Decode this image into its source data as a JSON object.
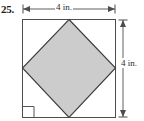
{
  "figure": {
    "problem_number": "25.",
    "shape_outer": "square",
    "shape_inner": "square-rotated-45-inscribed",
    "right_angle_mark": "right-angle-mark",
    "colors": {
      "inner_fill": "#cccccc",
      "outer_fill": "#ffffff",
      "stroke": "#4d4d4d",
      "inner_stroke": "#3a3a3a",
      "text": "#1a1a1a"
    },
    "dimensions": {
      "top": {
        "label": "4 in.",
        "value": 4,
        "unit": "in.",
        "orientation": "horizontal"
      },
      "right": {
        "label": "4 in.",
        "value": 4,
        "unit": "in.",
        "orientation": "vertical"
      }
    },
    "geometry": {
      "square": {
        "left": 22,
        "top": 19,
        "right": 116,
        "bottom": 118
      },
      "diamond_vertices": [
        {
          "name": "top",
          "x": 69,
          "y": 19
        },
        {
          "name": "right",
          "x": 116,
          "y": 68
        },
        {
          "name": "bottom",
          "x": 69,
          "y": 118
        },
        {
          "name": "left",
          "x": 22,
          "y": 68
        }
      ],
      "right_angle_mark": {
        "x": 23,
        "y": 104,
        "size": 11
      }
    }
  }
}
